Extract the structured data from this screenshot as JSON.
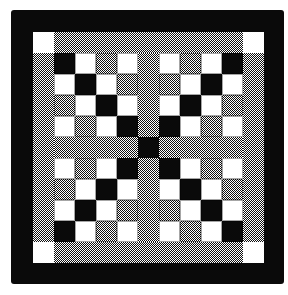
{
  "colors": {
    "black": "#0a0a0a",
    "white": "#ffffff",
    "grey_dither": "50% black/white pixel dither"
  },
  "layout": {
    "grid_size": 11,
    "cell_px": 21,
    "description": "Black outer border; white corner squares; grey dithered edge strips and central cross sashing with black center square; four 4x4 blocks of black/white/grey squares"
  },
  "blocks": {
    "top_left": [
      [
        "B",
        "W",
        "G",
        "W"
      ],
      [
        "W",
        "B",
        "W",
        "G"
      ],
      [
        "G",
        "W",
        "B",
        "W"
      ],
      [
        "W",
        "G",
        "W",
        "B"
      ]
    ],
    "top_right": [
      [
        "W",
        "G",
        "W",
        "B"
      ],
      [
        "G",
        "W",
        "B",
        "W"
      ],
      [
        "W",
        "B",
        "W",
        "G"
      ],
      [
        "B",
        "W",
        "G",
        "W"
      ]
    ],
    "bottom_left": [
      [
        "W",
        "G",
        "W",
        "B"
      ],
      [
        "G",
        "W",
        "B",
        "W"
      ],
      [
        "W",
        "B",
        "W",
        "G"
      ],
      [
        "B",
        "W",
        "G",
        "W"
      ]
    ],
    "bottom_right": [
      [
        "B",
        "W",
        "G",
        "W"
      ],
      [
        "W",
        "B",
        "W",
        "G"
      ],
      [
        "G",
        "W",
        "B",
        "W"
      ],
      [
        "W",
        "G",
        "W",
        "B"
      ]
    ]
  },
  "center_square": "B",
  "corner_squares": "W"
}
